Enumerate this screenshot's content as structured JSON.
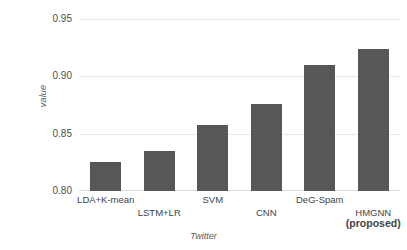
{
  "chart_data": {
    "type": "bar",
    "title": "",
    "xlabel": "Twitter",
    "ylabel": "value",
    "categories": [
      "LDA+K-mean",
      "LSTM+LR",
      "SVM",
      "CNN",
      "DeG-Spam",
      "HMGNN (proposed)"
    ],
    "values": [
      0.825,
      0.835,
      0.858,
      0.876,
      0.91,
      0.924
    ],
    "ylim": [
      0.8,
      0.95
    ],
    "yticks": [
      "0.80",
      "0.85",
      "0.90",
      "0.95"
    ],
    "ytick_values": [
      0.8,
      0.85,
      0.9,
      0.95
    ],
    "grid": true,
    "legend": "none",
    "bar_color": "#575757",
    "grid_color": "#e6e7e8",
    "axis_text_color": "#3f4347"
  },
  "axis": {
    "y_label": "value",
    "x_label": "Twitter"
  },
  "xticks": [
    {
      "line1": "LDA+K-mean",
      "line2": "",
      "row": 0
    },
    {
      "line1": "LSTM+LR",
      "line2": "",
      "row": 1
    },
    {
      "line1": "SVM",
      "line2": "",
      "row": 0
    },
    {
      "line1": "CNN",
      "line2": "",
      "row": 1
    },
    {
      "line1": "DeG-Spam",
      "line2": "",
      "row": 0
    },
    {
      "line1": "HMGNN",
      "line2": "(proposed)",
      "row": 1
    }
  ]
}
